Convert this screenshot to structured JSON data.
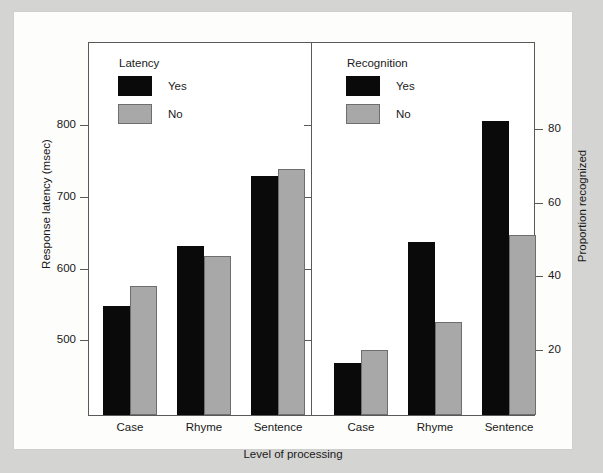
{
  "chart_data": {
    "type": "bar",
    "title": "",
    "xlabel": "Level of processing",
    "categories": [
      "Case",
      "Rhyme",
      "Sentence"
    ],
    "panels": [
      {
        "name": "Latency",
        "legend_title": "Latency",
        "ylabel": "Response latency (msec)",
        "ytick_labels": [
          "800",
          "700",
          "600",
          "500"
        ],
        "yticks": [
          800,
          700,
          600,
          500
        ],
        "ylim": [
          430,
          840
        ],
        "series": [
          {
            "name": "Yes",
            "color": "#0a0a0a",
            "values": [
              552,
              636,
              734
            ]
          },
          {
            "name": "No",
            "color": "#a8a8a8",
            "values": [
              580,
              622,
              743
            ]
          }
        ]
      },
      {
        "name": "Recognition",
        "legend_title": "Recognition",
        "ylabel": "Proportion recognized",
        "ytick_labels": [
          "80",
          "60",
          "40",
          "20"
        ],
        "yticks": [
          80,
          60,
          40,
          20
        ],
        "ylim": [
          0,
          95
        ],
        "series": [
          {
            "name": "Yes",
            "color": "#0a0a0a",
            "values": [
              17,
              50,
              83
            ]
          },
          {
            "name": "No",
            "color": "#a8a8a8",
            "values": [
              21,
              28,
              52
            ]
          }
        ]
      }
    ],
    "legend_position": "inside-top-left-of-each-panel",
    "grid": false
  },
  "axes": {
    "left": {
      "label": "Response latency (msec)",
      "ticks": [
        {
          "label": "800",
          "top": 113
        },
        {
          "label": "700",
          "top": 185
        },
        {
          "label": "600",
          "top": 257
        },
        {
          "label": "500",
          "top": 328
        }
      ]
    },
    "right": {
      "label": "Proportion recognized",
      "ticks": [
        {
          "label": "80",
          "top": 117
        },
        {
          "label": "60",
          "top": 191
        },
        {
          "label": "40",
          "top": 264
        },
        {
          "label": "20",
          "top": 338
        }
      ]
    }
  },
  "legends": {
    "latency": {
      "title": "Latency",
      "rows": [
        {
          "label": "Yes",
          "swatch": "black"
        },
        {
          "label": "No",
          "swatch": "gray"
        }
      ]
    },
    "recognition": {
      "title": "Recognition",
      "rows": [
        {
          "label": "Yes",
          "swatch": "black"
        },
        {
          "label": "No",
          "swatch": "gray"
        }
      ]
    }
  },
  "bars": {
    "left": [
      {
        "cat": "Case",
        "series": "Yes",
        "value": 552,
        "left": 89,
        "width": 27,
        "height": 109
      },
      {
        "cat": "Case",
        "series": "No",
        "value": 580,
        "left": 116,
        "width": 27,
        "height": 129
      },
      {
        "cat": "Rhyme",
        "series": "Yes",
        "value": 636,
        "left": 163,
        "width": 27,
        "height": 169
      },
      {
        "cat": "Rhyme",
        "series": "No",
        "value": 622,
        "left": 190,
        "width": 27,
        "height": 159
      },
      {
        "cat": "Sentence",
        "series": "Yes",
        "value": 734,
        "left": 237,
        "width": 27,
        "height": 239
      },
      {
        "cat": "Sentence",
        "series": "No",
        "value": 743,
        "left": 264,
        "width": 27,
        "height": 246
      }
    ],
    "right": [
      {
        "cat": "Case",
        "series": "Yes",
        "value": 17,
        "left": 320,
        "width": 27,
        "height": 52
      },
      {
        "cat": "Case",
        "series": "No",
        "value": 21,
        "left": 347,
        "width": 27,
        "height": 65
      },
      {
        "cat": "Rhyme",
        "series": "Yes",
        "value": 50,
        "left": 394,
        "width": 27,
        "height": 173
      },
      {
        "cat": "Rhyme",
        "series": "No",
        "value": 28,
        "left": 421,
        "width": 27,
        "height": 93
      },
      {
        "cat": "Sentence",
        "series": "Yes",
        "value": 83,
        "left": 468,
        "width": 27,
        "height": 294
      },
      {
        "cat": "Sentence",
        "series": "No",
        "value": 52,
        "left": 495,
        "width": 27,
        "height": 180
      }
    ]
  },
  "category_labels": [
    {
      "text": "Case",
      "left": 82,
      "width": 68
    },
    {
      "text": "Rhyme",
      "left": 156,
      "width": 68
    },
    {
      "text": "Sentence",
      "left": 228,
      "width": 72
    },
    {
      "text": "Case",
      "left": 313,
      "width": 68
    },
    {
      "text": "Rhyme",
      "left": 387,
      "width": 68
    },
    {
      "text": "Sentence",
      "left": 459,
      "width": 72
    }
  ],
  "xlabel": "Level of processing"
}
